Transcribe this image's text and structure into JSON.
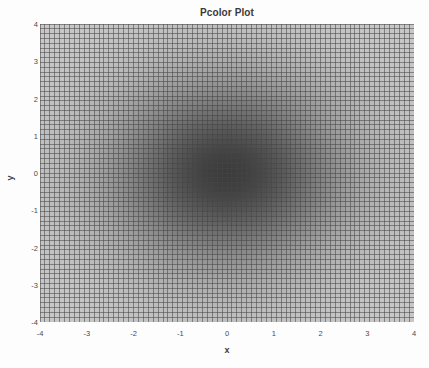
{
  "chart_data": {
    "type": "heatmap",
    "title": "Pcolor Plot",
    "xlabel": "x",
    "ylabel": "y",
    "xlim": [
      -4,
      4
    ],
    "ylim": [
      -4,
      4
    ],
    "xticks": [
      "-4",
      "-3",
      "-2",
      "-1",
      "0",
      "1",
      "2",
      "3",
      "4"
    ],
    "yticks": [
      "4",
      "3",
      "2",
      "1",
      "0",
      "-1",
      "-2",
      "-3",
      "-4"
    ],
    "xtick_values": [
      -4,
      -3,
      -2,
      -1,
      0,
      1,
      2,
      3,
      4
    ],
    "ytick_values": [
      4,
      3,
      2,
      1,
      0,
      -1,
      -2,
      -3,
      -4
    ],
    "grid": true,
    "legend": "none",
    "colormap": "gray-reversed",
    "mesh_cols": 76,
    "mesh_rows": 62,
    "edge_color": "#6e6e6e",
    "value_min": 0.0,
    "value_max": 1.0,
    "center_value": 1.0,
    "corner_value": 0.02,
    "function": "radial gaussian peak at origin, sigma approx 1.7",
    "sigma": 1.7,
    "cell_fill_light": "#c8c8c8",
    "cell_fill_dark": "#3c3c3c"
  },
  "figure": {
    "background_color": "#fdfdfd",
    "text_color": "#3a3a3a",
    "tick_color": "#4a4a4a"
  }
}
